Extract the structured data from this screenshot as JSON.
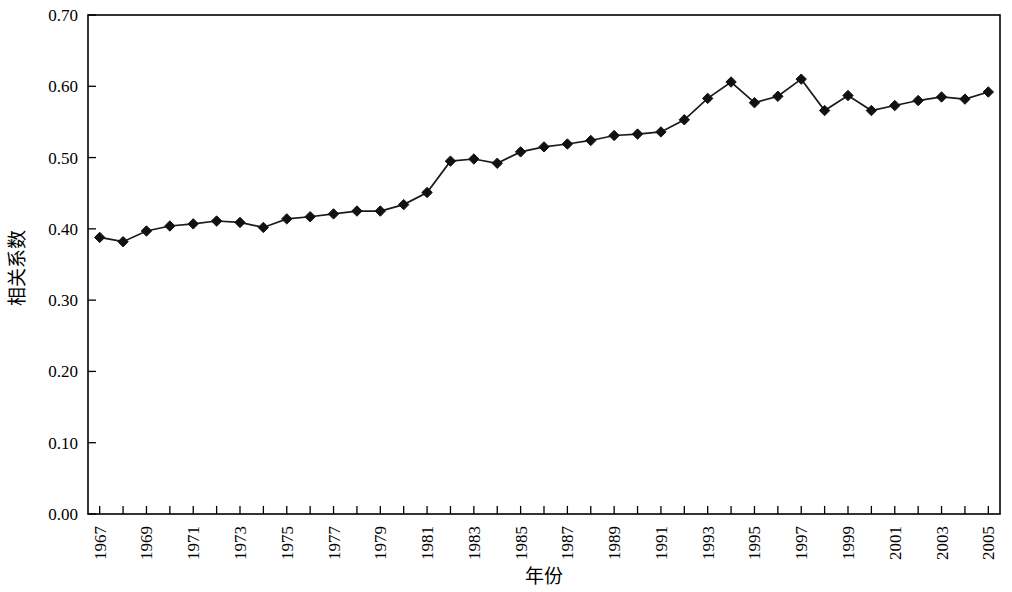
{
  "chart_data": {
    "type": "line",
    "title": "",
    "xlabel": "年份",
    "ylabel": "相关系数",
    "grid": false,
    "legend": null,
    "marker": "diamond",
    "marker_color": "#111111",
    "line_color": "#1a1a1a",
    "xlim": [
      1966.5,
      2005.5
    ],
    "ylim": [
      0.0,
      0.7
    ],
    "ytick_labels": [
      "0.70",
      "0.60",
      "0.50",
      "0.40",
      "0.30",
      "0.20",
      "0.10",
      "0.00"
    ],
    "ytick_values": [
      0.7,
      0.6,
      0.5,
      0.4,
      0.3,
      0.2,
      0.1,
      0.0
    ],
    "xtick_labels": [
      "1967",
      "1969",
      "1971",
      "1973",
      "1975",
      "1977",
      "1979",
      "1981",
      "1983",
      "1985",
      "1987",
      "1989",
      "1991",
      "1993",
      "1995",
      "1997",
      "1999",
      "2001",
      "2003",
      "2005"
    ],
    "xtick_label_values": [
      1967,
      1969,
      1971,
      1973,
      1975,
      1977,
      1979,
      1981,
      1983,
      1985,
      1987,
      1989,
      1991,
      1993,
      1995,
      1997,
      1999,
      2001,
      2003,
      2005
    ],
    "x": [
      1967,
      1968,
      1969,
      1970,
      1971,
      1972,
      1973,
      1974,
      1975,
      1976,
      1977,
      1978,
      1979,
      1980,
      1981,
      1982,
      1983,
      1984,
      1985,
      1986,
      1987,
      1988,
      1989,
      1990,
      1991,
      1992,
      1993,
      1994,
      1995,
      1996,
      1997,
      1998,
      1999,
      2000,
      2001,
      2002,
      2003,
      2004,
      2005
    ],
    "values": [
      0.388,
      0.382,
      0.397,
      0.404,
      0.407,
      0.411,
      0.409,
      0.402,
      0.414,
      0.417,
      0.421,
      0.425,
      0.425,
      0.434,
      0.451,
      0.495,
      0.498,
      0.492,
      0.508,
      0.515,
      0.519,
      0.524,
      0.531,
      0.533,
      0.536,
      0.553,
      0.583,
      0.606,
      0.577,
      0.586,
      0.61,
      0.566,
      0.587,
      0.566,
      0.573,
      0.58,
      0.585,
      0.582,
      0.592
    ]
  }
}
